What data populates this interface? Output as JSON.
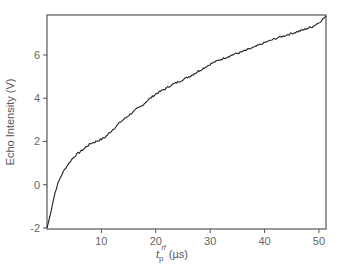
{
  "chart_data": {
    "type": "line",
    "title": "",
    "xlabel": "t_p^rf (µs)",
    "xlabel_parts": {
      "base": "t",
      "sub": "p",
      "sup": "rf",
      "unit": "(µs)"
    },
    "ylabel": "Echo Intensity (V)",
    "xlim": [
      0,
      51.3
    ],
    "ylim": [
      -2.05,
      7.85
    ],
    "xticks": [
      10,
      20,
      30,
      40,
      50
    ],
    "yticks": [
      -2,
      0,
      2,
      4,
      6
    ],
    "grid": false,
    "legend": null,
    "series": [
      {
        "name": "Echo Intensity",
        "color": "#222222",
        "x": [
          0,
          0.5,
          1.0,
          1.5,
          2.0,
          2.5,
          3.0,
          3.5,
          3.9,
          4.5,
          5.0,
          5.7,
          6.5,
          7.2,
          8.0,
          9.0,
          10.0,
          10.7,
          11.5,
          12.5,
          13.5,
          14.5,
          15.5,
          16.5,
          17.2,
          18.5,
          20.0,
          21.5,
          22.8,
          24.5,
          26.5,
          28.5,
          30.2,
          32.0,
          34.0,
          35.7,
          38.0,
          40.3,
          42.5,
          45.0,
          47.0,
          48.7,
          50.0,
          51.3
        ],
        "y": [
          -2.0,
          -1.5,
          -0.9,
          -0.35,
          0.05,
          0.35,
          0.6,
          0.8,
          0.95,
          1.15,
          1.3,
          1.45,
          1.6,
          1.75,
          1.9,
          2.0,
          2.1,
          2.2,
          2.4,
          2.65,
          2.9,
          3.1,
          3.3,
          3.5,
          3.6,
          3.9,
          4.2,
          4.4,
          4.6,
          4.8,
          5.05,
          5.35,
          5.6,
          5.8,
          6.0,
          6.13,
          6.35,
          6.6,
          6.8,
          7.0,
          7.15,
          7.3,
          7.5,
          7.8
        ]
      }
    ]
  }
}
